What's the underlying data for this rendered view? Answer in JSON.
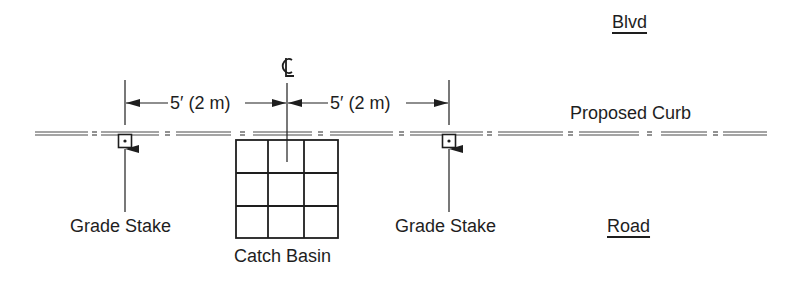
{
  "diagram": {
    "type": "plan-view layout sketch",
    "labels": {
      "top_street": "Blvd",
      "bottom_street": "Road",
      "curb": "Proposed Curb",
      "left_stake": "Grade Stake",
      "right_stake": "Grade Stake",
      "basin": "Catch Basin",
      "centerline_symbol": "CL"
    },
    "dimensions": {
      "left": "5′ (2 m)",
      "right": "5′ (2 m)"
    },
    "catch_basin_grid": {
      "rows": 3,
      "cols": 3
    },
    "colors": {
      "ink": "#1e1e1e",
      "background": "#ffffff"
    }
  }
}
